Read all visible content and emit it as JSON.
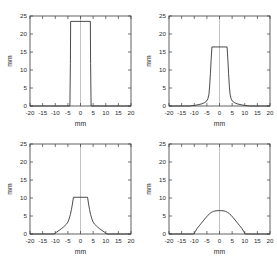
{
  "figure": {
    "layout": "2x2 grid of line plots",
    "panel_order": [
      "top-left",
      "top-right",
      "bottom-left",
      "bottom-right"
    ]
  },
  "axes": {
    "xlabel": "mm",
    "ylabel": "mm",
    "xticks": [
      -20,
      -15,
      -10,
      -5,
      0,
      5,
      10,
      15,
      20
    ],
    "xticklabels": [
      "-20",
      "-15",
      "-10",
      "-5",
      "0",
      "5",
      "10",
      "15",
      "20"
    ],
    "yticks": [
      0,
      5,
      10,
      15,
      20,
      25
    ],
    "yticklabels": [
      "0",
      "5",
      "10",
      "15",
      "20",
      "25"
    ],
    "xlim": [
      -20,
      20
    ],
    "ylim": [
      0,
      25
    ]
  },
  "colors": {
    "curve": "#2b2b2b",
    "frame": "#3a3a3a",
    "zeroline": "#9a9a9a",
    "background": "#ffffff"
  },
  "chart_data": [
    {
      "type": "line",
      "panel": "top-left",
      "title": "",
      "xlabel": "mm",
      "ylabel": "mm",
      "xlim": [
        -20,
        20
      ],
      "ylim": [
        0,
        25
      ],
      "grid": false,
      "legend": "none",
      "plateau_height": 23.5,
      "x": [
        -20,
        -4.2,
        -4.0,
        -3.9,
        3.9,
        4.0,
        4.2,
        20
      ],
      "y": [
        0,
        0,
        11.8,
        23.5,
        23.5,
        11.8,
        0,
        0
      ]
    },
    {
      "type": "line",
      "panel": "top-right",
      "title": "",
      "xlabel": "mm",
      "ylabel": "mm",
      "xlim": [
        -20,
        20
      ],
      "ylim": [
        0,
        25
      ],
      "grid": false,
      "legend": "none",
      "plateau_height": 16.8,
      "x": [
        -20,
        -12,
        -10,
        -8.5,
        -7,
        -6,
        -5.2,
        -4.6,
        -4.2,
        -3.9,
        -3.6,
        -3.3,
        -3.0,
        3.0,
        3.3,
        3.6,
        3.9,
        4.2,
        4.6,
        5.2,
        6,
        7,
        8.5,
        10,
        12,
        20
      ],
      "y": [
        0,
        0,
        0.15,
        0.35,
        0.6,
        0.9,
        1.3,
        2.0,
        3.2,
        5.5,
        9.0,
        13.0,
        16.4,
        16.4,
        13.0,
        9.0,
        5.5,
        3.2,
        2.0,
        1.3,
        0.9,
        0.6,
        0.35,
        0.15,
        0,
        0
      ]
    },
    {
      "type": "line",
      "panel": "bottom-left",
      "title": "",
      "xlabel": "mm",
      "ylabel": "mm",
      "xlim": [
        -20,
        20
      ],
      "ylim": [
        0,
        25
      ],
      "grid": false,
      "legend": "none",
      "plateau_height": 10.6,
      "x": [
        -20,
        -10.5,
        -9.5,
        -8.5,
        -7.5,
        -6.8,
        -6.2,
        -5.6,
        -5.0,
        -4.5,
        -4.0,
        -3.6,
        -3.2,
        -2.8,
        2.8,
        3.2,
        3.6,
        4.0,
        4.5,
        5.0,
        5.6,
        6.2,
        6.8,
        7.5,
        8.5,
        9.5,
        10.5,
        20
      ],
      "y": [
        0,
        0,
        0.5,
        1.0,
        1.5,
        1.9,
        2.3,
        2.7,
        3.3,
        4.2,
        5.4,
        6.8,
        8.3,
        10.2,
        10.2,
        8.3,
        6.8,
        5.4,
        4.2,
        3.3,
        2.7,
        2.3,
        1.9,
        1.5,
        1.0,
        0.5,
        0,
        0
      ]
    },
    {
      "type": "line",
      "panel": "bottom-right",
      "title": "",
      "xlabel": "mm",
      "ylabel": "mm",
      "xlim": [
        -20,
        20
      ],
      "ylim": [
        0,
        25
      ],
      "grid": false,
      "legend": "none",
      "plateau_height": 6.5,
      "x": [
        -20,
        -10.2,
        -9.5,
        -8.8,
        -8.0,
        -7.2,
        -6.5,
        -5.8,
        -5.2,
        -4.6,
        -4.0,
        -3.2,
        -2.4,
        -1.4,
        0,
        1.4,
        2.4,
        3.2,
        4.0,
        4.6,
        5.2,
        5.8,
        6.5,
        7.2,
        8.0,
        8.8,
        9.5,
        10.2,
        20
      ],
      "y": [
        0,
        0,
        0.8,
        1.6,
        2.3,
        3.0,
        3.6,
        4.2,
        4.7,
        5.2,
        5.6,
        6.0,
        6.3,
        6.45,
        6.5,
        6.45,
        6.3,
        6.0,
        5.6,
        5.2,
        4.7,
        4.2,
        3.6,
        3.0,
        2.3,
        1.6,
        0.8,
        0,
        0
      ]
    }
  ]
}
